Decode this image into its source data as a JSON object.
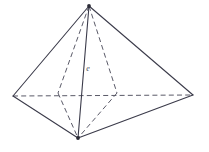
{
  "figure": {
    "type": "geometric-solid-diagram",
    "colors": {
      "background": "#ffffff",
      "visible_edge": "#3b3b4a",
      "hidden_edge": "#5a5a68",
      "vertex": "#2b2b36",
      "label": "#4a4a56"
    },
    "canvas": {
      "width": 209,
      "height": 152
    },
    "labels": [
      {
        "id": "edge-label-e",
        "text": "e",
        "x": 88,
        "y": 71
      }
    ],
    "vertices": [
      {
        "id": "apex",
        "x": 89,
        "y": 6,
        "marked": true
      },
      {
        "id": "left",
        "x": 13,
        "y": 96,
        "marked": false
      },
      {
        "id": "right",
        "x": 193,
        "y": 95,
        "marked": false
      },
      {
        "id": "front-bottom",
        "x": 78,
        "y": 138,
        "marked": true
      },
      {
        "id": "back-left",
        "x": 58,
        "y": 93,
        "marked": false
      },
      {
        "id": "back-right",
        "x": 117,
        "y": 93,
        "marked": false
      }
    ],
    "edges_solid": [
      {
        "id": "apex-left",
        "x1": 89,
        "y1": 6,
        "x2": 13,
        "y2": 96
      },
      {
        "id": "apex-right",
        "x1": 89,
        "y1": 6,
        "x2": 193,
        "y2": 95
      },
      {
        "id": "apex-front-bottom",
        "x1": 89,
        "y1": 6,
        "x2": 78,
        "y2": 138
      },
      {
        "id": "left-front-bottom",
        "x1": 13,
        "y1": 96,
        "x2": 78,
        "y2": 138
      },
      {
        "id": "right-front-bottom",
        "x1": 193,
        "y1": 95,
        "x2": 78,
        "y2": 138
      }
    ],
    "edges_hidden": [
      {
        "id": "left-right-diagonal",
        "x1": 13,
        "y1": 96,
        "x2": 193,
        "y2": 95
      },
      {
        "id": "apex-back-left",
        "x1": 89,
        "y1": 6,
        "x2": 58,
        "y2": 93
      },
      {
        "id": "apex-back-right",
        "x1": 89,
        "y1": 6,
        "x2": 117,
        "y2": 93
      },
      {
        "id": "back-left-front-bottom",
        "x1": 58,
        "y1": 93,
        "x2": 78,
        "y2": 138
      },
      {
        "id": "back-right-front-bottom",
        "x1": 117,
        "y1": 93,
        "x2": 78,
        "y2": 138
      }
    ]
  }
}
